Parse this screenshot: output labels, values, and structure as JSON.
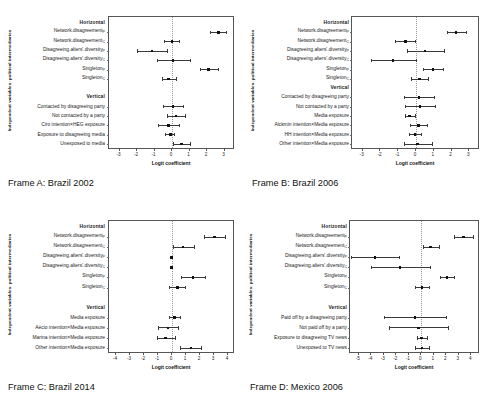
{
  "figure": {
    "axis_title_y": "Independent variables: political intermediaries",
    "axis_title_x": "Logit coefficient",
    "section_horizontal": "Horizontal",
    "section_vertical": "Vertical"
  },
  "chart_data": [
    {
      "type": "scatter",
      "id": "frame-a",
      "title": "Frame A: Brazil 2002",
      "xlabel": "Logit coefficient",
      "ylabel": "Independent variables: political intermediaries",
      "xlim": [
        -3.6,
        3.6
      ],
      "xticks": [
        -3,
        -2,
        -1,
        0,
        1,
        2,
        3
      ],
      "xticklabels": [
        "-3",
        "-2",
        "-1",
        "0",
        "1",
        "2",
        "3"
      ],
      "grid": false,
      "zero_reference_line": 0,
      "rows": [
        {
          "label": "Horizontal",
          "type": "header"
        },
        {
          "label": "Network.disagreement",
          "sub": "P",
          "estimate": 2.65,
          "ci_low": 2.15,
          "ci_high": 3.1
        },
        {
          "label": "Network.disagreement",
          "sub": "C",
          "estimate": 0.0,
          "ci_low": -0.45,
          "ci_high": 0.42
        },
        {
          "label": "Disagreeing.alters'.diversity",
          "sub": "P",
          "estimate": -1.15,
          "ci_low": -2.0,
          "ci_high": -0.3
        },
        {
          "label": "Disagreeing.alters'.diversity",
          "sub": "C",
          "estimate": 0.05,
          "ci_low": -0.85,
          "ci_high": 1.0
        },
        {
          "label": "Singleton",
          "sub": "P",
          "estimate": 2.1,
          "ci_low": 1.6,
          "ci_high": 2.6
        },
        {
          "label": "Singleton",
          "sub": "C",
          "estimate": -0.2,
          "ci_low": -0.6,
          "ci_high": 0.22
        },
        {
          "label": "",
          "type": "spacer"
        },
        {
          "label": "Vertical",
          "type": "header"
        },
        {
          "label": "Contacted by disagreeing party",
          "estimate": 0.05,
          "ci_low": -0.5,
          "ci_high": 0.6
        },
        {
          "label": "Not contacted by a party",
          "estimate": 0.22,
          "ci_low": -0.3,
          "ci_high": 0.72
        },
        {
          "label": "Ciro intention×HEG exposure",
          "estimate": -0.2,
          "ci_low": -0.8,
          "ci_high": 0.4
        },
        {
          "label": "Exposure to disagreeing media",
          "estimate": -0.1,
          "ci_low": -0.38,
          "ci_high": 0.1
        },
        {
          "label": "Unexposed to media",
          "estimate": 0.55,
          "ci_low": 0.05,
          "ci_high": 1.05
        }
      ]
    },
    {
      "type": "scatter",
      "id": "frame-b",
      "title": "Frame B: Brazil 2006",
      "xlabel": "Logit coefficient",
      "ylabel": "Independent variables: political intermediaries",
      "xlim": [
        -3.6,
        3.6
      ],
      "xticks": [
        -3,
        -2,
        -1,
        0,
        1,
        2,
        3
      ],
      "xticklabels": [
        "-3",
        "-2",
        "-1",
        "0",
        "1",
        "2",
        "3"
      ],
      "grid": false,
      "zero_reference_line": 0,
      "rows": [
        {
          "label": "Horizontal",
          "type": "header"
        },
        {
          "label": "Network.disagreement",
          "sub": "P",
          "estimate": 2.25,
          "ci_low": 1.75,
          "ci_high": 2.8
        },
        {
          "label": "Network.disagreement",
          "sub": "C",
          "estimate": -0.6,
          "ci_low": -1.2,
          "ci_high": -0.05
        },
        {
          "label": "Disagreeing.alters'.diversity",
          "sub": "P",
          "estimate": 0.5,
          "ci_low": -0.5,
          "ci_high": 1.55
        },
        {
          "label": "Disagreeing.alters'.diversity",
          "sub": "C",
          "estimate": -1.3,
          "ci_low": -2.55,
          "ci_high": -0.02
        },
        {
          "label": "Singleton",
          "sub": "P",
          "estimate": 0.95,
          "ci_low": 0.4,
          "ci_high": 1.5
        },
        {
          "label": "Singleton",
          "sub": "C",
          "estimate": 0.2,
          "ci_low": -0.3,
          "ci_high": 0.7
        },
        {
          "label": "Vertical",
          "type": "header"
        },
        {
          "label": "Contacted by disagreeing party",
          "estimate": 0.18,
          "ci_low": -0.65,
          "ci_high": 1.02
        },
        {
          "label": "Not contacted by a party",
          "estimate": 0.22,
          "ci_low": -0.6,
          "ci_high": 1.05
        },
        {
          "label": "Media exposure",
          "estimate": -0.35,
          "ci_low": -0.62,
          "ci_high": -0.08
        },
        {
          "label": "Alckmin intention×Media exposure",
          "estimate": 0.15,
          "ci_low": -0.35,
          "ci_high": 0.62
        },
        {
          "label": "HH intention×Media exposure",
          "estimate": -0.05,
          "ci_low": -0.42,
          "ci_high": 0.28
        },
        {
          "label": "Other intention×Media exposure",
          "estimate": 0.1,
          "ci_low": -0.7,
          "ci_high": 0.9
        }
      ]
    },
    {
      "type": "scatter",
      "id": "frame-c",
      "title": "Frame C: Brazil 2014",
      "xlabel": "Logit coefficient",
      "ylabel": "Independent variables: political intermediaries",
      "xlim": [
        -4.5,
        4.5
      ],
      "xticks": [
        -4,
        -3,
        -2,
        -1,
        0,
        1,
        2,
        3,
        4
      ],
      "xticklabels": [
        "-4",
        "-3",
        "-2",
        "-1",
        "0",
        "1",
        "2",
        "3",
        "4"
      ],
      "grid": false,
      "zero_reference_line": 0,
      "rows": [
        {
          "label": "Horizontal",
          "type": "header"
        },
        {
          "label": "Network.disagreement",
          "sub": "P",
          "estimate": 3.05,
          "ci_low": 2.3,
          "ci_high": 3.78
        },
        {
          "label": "Network.disagreement",
          "sub": "C",
          "estimate": 0.8,
          "ci_low": 0.05,
          "ci_high": 1.55
        },
        {
          "label": "Disagreeing.alters'.diversity",
          "sub": "P",
          "estimate": -0.05,
          "ci_low": -0.12,
          "ci_high": 0.02
        },
        {
          "label": "Disagreeing.alters'.diversity",
          "sub": "C",
          "estimate": -0.05,
          "ci_low": -0.12,
          "ci_high": 0.02
        },
        {
          "label": "Singleton",
          "sub": "P",
          "estimate": 1.5,
          "ci_low": 0.62,
          "ci_high": 2.38
        },
        {
          "label": "Singleton",
          "sub": "C",
          "estimate": 0.38,
          "ci_low": -0.18,
          "ci_high": 0.95
        },
        {
          "label": "",
          "type": "spacer"
        },
        {
          "label": "Vertical",
          "type": "header"
        },
        {
          "label": "Media exposure",
          "estimate": 0.18,
          "ci_low": -0.25,
          "ci_high": 0.6
        },
        {
          "label": "Aécio intention×Media exposure",
          "estimate": -0.3,
          "ci_low": -1.0,
          "ci_high": 0.42
        },
        {
          "label": "Marina intention×Media exposure",
          "estimate": -0.45,
          "ci_low": -1.1,
          "ci_high": 0.18
        },
        {
          "label": "Other intention×Media exposure",
          "estimate": 1.35,
          "ci_low": 0.58,
          "ci_high": 2.1
        }
      ]
    },
    {
      "type": "scatter",
      "id": "frame-d",
      "title": "Frame D: Mexico 2006",
      "xlabel": "Logit coefficient",
      "ylabel": "Independent variables: political intermediaries",
      "xlim": [
        -5.7,
        4.7
      ],
      "xticks": [
        -5,
        -4,
        -3,
        -2,
        -1,
        0,
        1,
        2,
        3,
        4
      ],
      "xticklabels": [
        "-5",
        "-4",
        "-3",
        "-2",
        "-1",
        "0",
        "1",
        "2",
        "3",
        "4"
      ],
      "grid": false,
      "zero_reference_line": 0,
      "rows": [
        {
          "label": "Horizontal",
          "type": "header"
        },
        {
          "label": "Network.disagreement",
          "sub": "P",
          "estimate": 3.4,
          "ci_low": 2.62,
          "ci_high": 4.15
        },
        {
          "label": "Network.disagreement",
          "sub": "C",
          "estimate": 0.75,
          "ci_low": 0.1,
          "ci_high": 1.4
        },
        {
          "label": "Disagreeing.alters'.diversity",
          "sub": "P",
          "estimate": -3.7,
          "ci_low": -5.6,
          "ci_high": -1.75
        },
        {
          "label": "Disagreeing.alters'.diversity",
          "sub": "C",
          "estimate": -1.7,
          "ci_low": -4.0,
          "ci_high": 0.7
        },
        {
          "label": "Singleton",
          "sub": "P",
          "estimate": 2.05,
          "ci_low": 1.5,
          "ci_high": 2.6
        },
        {
          "label": "Singleton",
          "sub": "C",
          "estimate": 0.05,
          "ci_low": -0.5,
          "ci_high": 0.6
        },
        {
          "label": "",
          "type": "spacer"
        },
        {
          "label": "Vertical",
          "type": "header"
        },
        {
          "label": "Paid off by a disagreeing party",
          "estimate": -0.5,
          "ci_low": -3.0,
          "ci_high": 1.95
        },
        {
          "label": "Not paid off by a party",
          "estimate": -0.2,
          "ci_low": -2.62,
          "ci_high": 2.1
        },
        {
          "label": "Exposure to disagreeing TV news",
          "estimate": 0.0,
          "ci_low": -0.35,
          "ci_high": 0.42
        },
        {
          "label": "Unexposed to TV news",
          "estimate": 0.05,
          "ci_low": -0.5,
          "ci_high": 0.6
        }
      ]
    }
  ]
}
